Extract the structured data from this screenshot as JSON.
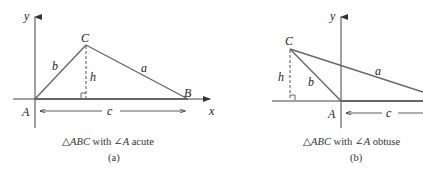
{
  "panel_a": {
    "labels": {
      "y_axis": "y",
      "x_axis": "x",
      "A": "A",
      "B": "B",
      "C": "C",
      "side_a": "a",
      "side_b": "b",
      "side_c": "c",
      "height": "h"
    },
    "caption": {
      "triangle_symbol": "△",
      "triangle": "ABC",
      "with": " with ",
      "angle_symbol": "∠",
      "angle": "A",
      "description": " acute"
    },
    "sublabel": "(a)"
  },
  "panel_b": {
    "labels": {
      "y_axis": "y",
      "A": "A",
      "C": "C",
      "side_a": "a",
      "side_b": "b",
      "side_c": "c",
      "height": "h"
    },
    "caption": {
      "triangle_symbol": "△",
      "triangle": "ABC",
      "with": " with ",
      "angle_symbol": "∠",
      "angle": "A",
      "description": " obtuse"
    },
    "sublabel": "(b)"
  },
  "colors": {
    "line": "#555555",
    "axis": "#444444",
    "text": "#222222"
  }
}
